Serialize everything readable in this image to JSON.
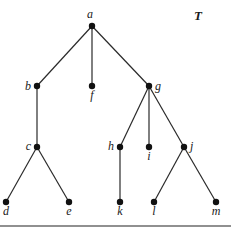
{
  "diagram": {
    "title": "T",
    "type": "rooted tree",
    "nodes": [
      {
        "id": "a",
        "label": "a",
        "x": 92,
        "y": 26,
        "label_dx": -2,
        "label_dy": -8,
        "anchor": "middle"
      },
      {
        "id": "b",
        "label": "b",
        "x": 37,
        "y": 86,
        "label_dx": -6,
        "label_dy": 4,
        "anchor": "end"
      },
      {
        "id": "f",
        "label": "f",
        "x": 92,
        "y": 86,
        "label_dx": 0,
        "label_dy": 13,
        "anchor": "middle"
      },
      {
        "id": "g",
        "label": "g",
        "x": 149,
        "y": 86,
        "label_dx": 6,
        "label_dy": 4,
        "anchor": "start"
      },
      {
        "id": "c",
        "label": "c",
        "x": 37,
        "y": 147,
        "label_dx": -6,
        "label_dy": 3,
        "anchor": "end"
      },
      {
        "id": "h",
        "label": "h",
        "x": 120,
        "y": 147,
        "label_dx": -6,
        "label_dy": 3,
        "anchor": "end"
      },
      {
        "id": "i",
        "label": "i",
        "x": 149,
        "y": 147,
        "label_dx": 0,
        "label_dy": 13,
        "anchor": "middle"
      },
      {
        "id": "j",
        "label": "j",
        "x": 184,
        "y": 147,
        "label_dx": 6,
        "label_dy": 3,
        "anchor": "start"
      },
      {
        "id": "d",
        "label": "d",
        "x": 6,
        "y": 202,
        "label_dx": 0,
        "label_dy": 13,
        "anchor": "middle"
      },
      {
        "id": "e",
        "label": "e",
        "x": 69,
        "y": 202,
        "label_dx": 0,
        "label_dy": 13,
        "anchor": "middle"
      },
      {
        "id": "k",
        "label": "k",
        "x": 120,
        "y": 202,
        "label_dx": 0,
        "label_dy": 13,
        "anchor": "middle"
      },
      {
        "id": "l",
        "label": "l",
        "x": 154,
        "y": 202,
        "label_dx": 0,
        "label_dy": 13,
        "anchor": "middle"
      },
      {
        "id": "m",
        "label": "m",
        "x": 216,
        "y": 202,
        "label_dx": 0,
        "label_dy": 13,
        "anchor": "middle"
      }
    ],
    "edges": [
      [
        "a",
        "b"
      ],
      [
        "a",
        "f"
      ],
      [
        "a",
        "g"
      ],
      [
        "b",
        "c"
      ],
      [
        "c",
        "d"
      ],
      [
        "c",
        "e"
      ],
      [
        "g",
        "h"
      ],
      [
        "g",
        "i"
      ],
      [
        "g",
        "j"
      ],
      [
        "h",
        "k"
      ],
      [
        "j",
        "l"
      ],
      [
        "j",
        "m"
      ]
    ],
    "colors": {
      "node": "#111111",
      "edge": "#2a2a2a",
      "background": "#ffffff"
    }
  }
}
